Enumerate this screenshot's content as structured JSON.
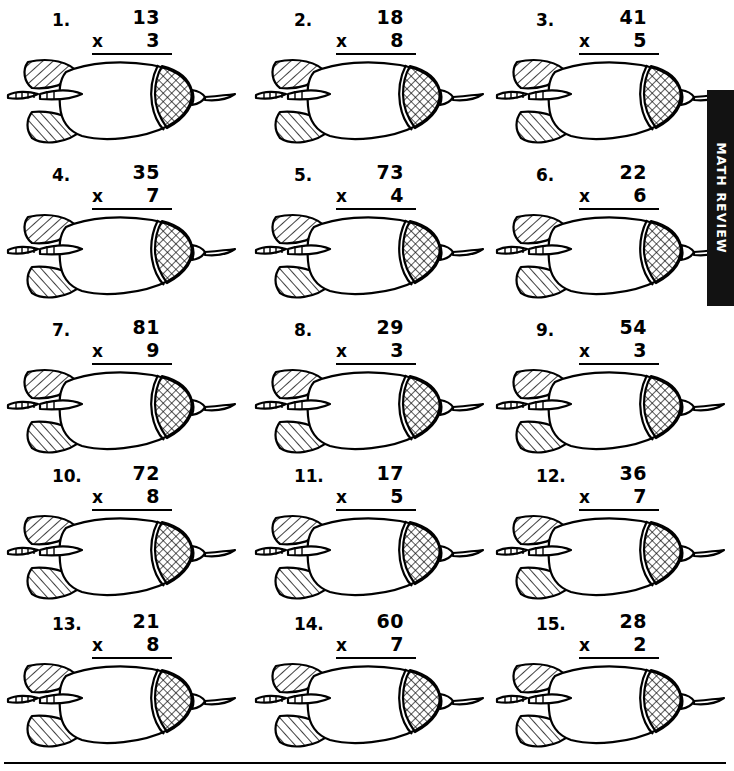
{
  "worksheet": {
    "side_tab_label": "MATH REVIEW",
    "operator": "x",
    "problems": [
      {
        "index": "1.",
        "top": "13",
        "operator": "x",
        "bottom": "3"
      },
      {
        "index": "2.",
        "top": "18",
        "operator": "x",
        "bottom": "8"
      },
      {
        "index": "3.",
        "top": "41",
        "operator": "x",
        "bottom": "5"
      },
      {
        "index": "4.",
        "top": "35",
        "operator": "x",
        "bottom": "7"
      },
      {
        "index": "5.",
        "top": "73",
        "operator": "x",
        "bottom": "4"
      },
      {
        "index": "6.",
        "top": "22",
        "operator": "x",
        "bottom": "6"
      },
      {
        "index": "7.",
        "top": "81",
        "operator": "x",
        "bottom": "9"
      },
      {
        "index": "8.",
        "top": "29",
        "operator": "x",
        "bottom": "3"
      },
      {
        "index": "9.",
        "top": "54",
        "operator": "x",
        "bottom": "3"
      },
      {
        "index": "10.",
        "top": "72",
        "operator": "x",
        "bottom": "8"
      },
      {
        "index": "11.",
        "top": "17",
        "operator": "x",
        "bottom": "5"
      },
      {
        "index": "12.",
        "top": "36",
        "operator": "x",
        "bottom": "7"
      },
      {
        "index": "13.",
        "top": "21",
        "operator": "x",
        "bottom": "8"
      },
      {
        "index": "14.",
        "top": "60",
        "operator": "x",
        "bottom": "7"
      },
      {
        "index": "15.",
        "top": "28",
        "operator": "x",
        "bottom": "2"
      }
    ],
    "illustration_name": "dart-illustration",
    "colors": {
      "ink": "#000000",
      "paper": "#ffffff",
      "tab_background": "#121212",
      "tab_text": "#ffffff"
    }
  }
}
